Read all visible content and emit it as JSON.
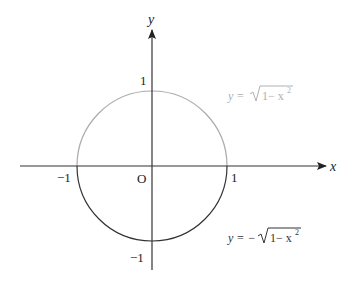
{
  "diagram": {
    "colors": {
      "background": "#ffffff",
      "axis": "#333333",
      "upper_arc": "#aaaaaa",
      "lower_arc": "#333333",
      "upper_equation": "#b0b0b0",
      "lower_equation": "#333333"
    },
    "axes": {
      "x_label": "x",
      "y_label": "y",
      "origin_label": "O"
    },
    "ticks": {
      "x_neg": "−1",
      "x_pos": "1",
      "y_pos": "1",
      "y_neg": "−1"
    },
    "curves": [
      {
        "name": "upper-semicircle",
        "equation_prefix": "y = ",
        "equation_radicand": "1− x",
        "equation_exponent": "2",
        "color": "#aaaaaa"
      },
      {
        "name": "lower-semicircle",
        "equation_prefix": "y = −",
        "equation_radicand": "1− x",
        "equation_exponent": "2",
        "color": "#333333"
      }
    ],
    "geometry": {
      "origin_px": [
        152,
        166
      ],
      "radius_px": 75
    }
  }
}
